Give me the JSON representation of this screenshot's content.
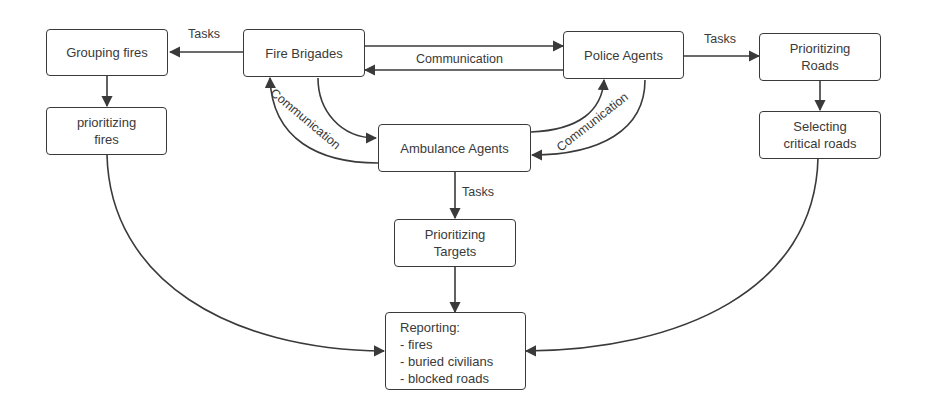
{
  "nodes": {
    "grouping_fires": {
      "lines": [
        "Grouping fires"
      ]
    },
    "fire_brigades": {
      "lines": [
        "Fire Brigades"
      ]
    },
    "police_agents": {
      "lines": [
        "Police Agents"
      ]
    },
    "prioritizing_roads": {
      "lines": [
        "Prioritizing",
        "Roads"
      ]
    },
    "prioritizing_fires": {
      "lines": [
        "prioritizing",
        "fires"
      ]
    },
    "ambulance_agents": {
      "lines": [
        "Ambulance Agents"
      ]
    },
    "selecting_roads": {
      "lines": [
        "Selecting",
        "critical roads"
      ]
    },
    "prioritizing_targets": {
      "lines": [
        "Prioritizing",
        "Targets"
      ]
    },
    "reporting": {
      "lines": [
        "Reporting:",
        "- fires",
        "- buried civilians",
        "- blocked roads"
      ]
    }
  },
  "edge_labels": {
    "fire_to_grouping": "Tasks",
    "fire_police": "Communication",
    "police_to_roads": "Tasks",
    "fire_ambulance": "Communication",
    "police_ambulance": "Communication",
    "ambulance_to_targets": "Tasks"
  },
  "colors": {
    "stroke": "#3a3a3a",
    "background": "#ffffff",
    "text": "#3a3a3a"
  }
}
